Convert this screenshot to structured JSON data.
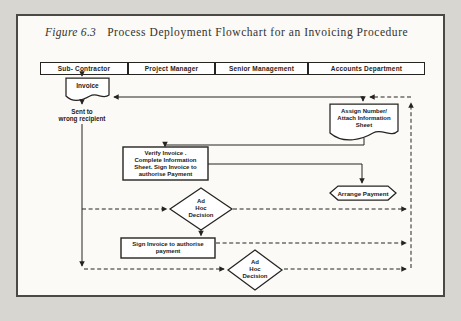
{
  "figure": {
    "label": "Figure 6.3",
    "title": "Process Deployment Flowchart for an Invoicing Procedure"
  },
  "lanes": [
    "Sub- Contractor",
    "Project Manager",
    "Senior Management",
    "Accounts Department"
  ],
  "nodes": {
    "invoice": "Invoice",
    "sent_to_wrong": "Sent to\nwrong recipient",
    "assign_number": "Assign Number/\nAttach Information\nSheet",
    "verify_invoice": "Verify Invoice .\nComplete Information\nSheet. Sign Invoice to\nauthorise Payment",
    "ad_hoc_1": "Ad\nHoc\nDecision",
    "arrange_payment": "Arrange Payment",
    "sign_invoice": "Sign Invoice to authorise\npayment",
    "ad_hoc_2": "Ad\nHoc\nDecision"
  },
  "colors": {
    "ink": "#262421",
    "paper": "#fbfaf6",
    "page_background": "#d8d6d1"
  }
}
